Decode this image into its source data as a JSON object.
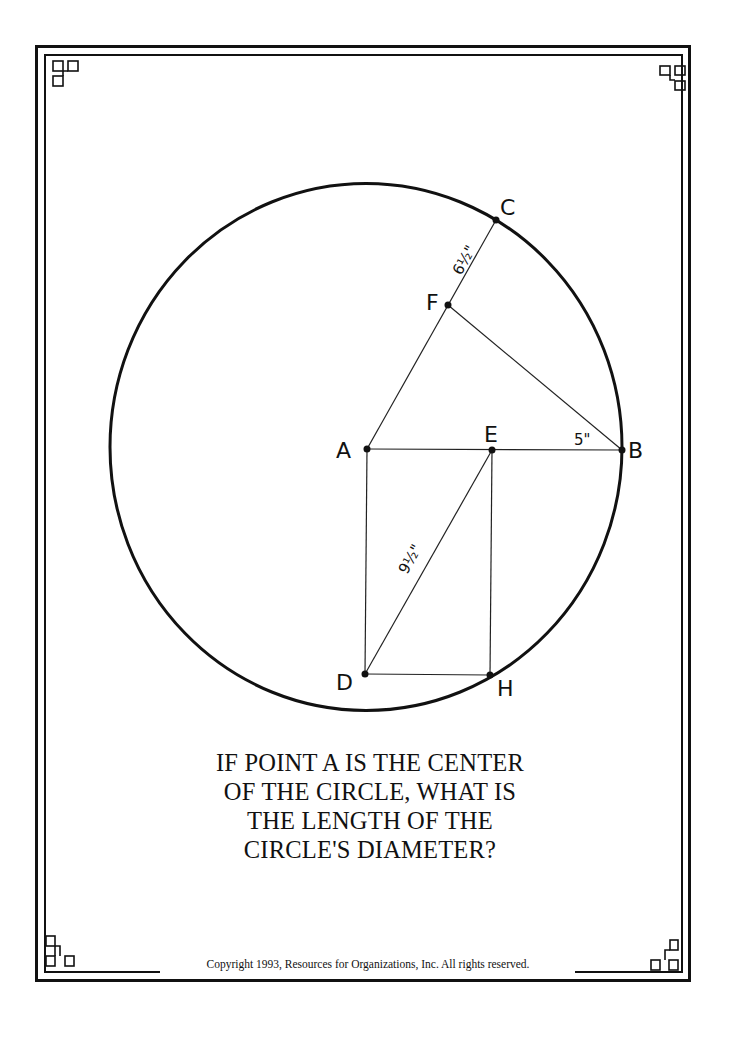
{
  "diagram": {
    "points": [
      {
        "name": "A",
        "x": 367,
        "y": 449
      },
      {
        "name": "B",
        "x": 622,
        "y": 450
      },
      {
        "name": "C",
        "x": 496,
        "y": 220
      },
      {
        "name": "D",
        "x": 365,
        "y": 674
      },
      {
        "name": "E",
        "x": 492,
        "y": 450
      },
      {
        "name": "F",
        "x": 448,
        "y": 305
      },
      {
        "name": "H",
        "x": 490,
        "y": 675
      }
    ],
    "segments": [
      "A-C",
      "A-B",
      "F-B",
      "A-D",
      "D-E",
      "E-H",
      "D-H"
    ],
    "circle": {
      "center": "A",
      "cx": 366,
      "cy": 447,
      "rx": 256,
      "ry": 263
    },
    "measurements": [
      {
        "segment": "F-C",
        "label": "6½\""
      },
      {
        "segment": "E-B",
        "label": "5\""
      },
      {
        "segment": "D-E",
        "label": "9½\""
      }
    ]
  },
  "labels": {
    "A": "A",
    "B": "B",
    "C": "C",
    "D": "D",
    "E": "E",
    "F": "F",
    "H": "H",
    "fc_length": "6½\"",
    "eb_length": "5\"",
    "de_length": "9½\""
  },
  "question": {
    "line1": "IF POINT A IS THE CENTER",
    "line2": "OF THE CIRCLE, WHAT IS",
    "line3": "THE LENGTH OF THE",
    "line4": "CIRCLE'S DIAMETER?"
  },
  "footer": {
    "copyright": "Copyright 1993, Resources for Organizations, Inc.  All rights reserved."
  },
  "colors": {
    "ink": "#111111",
    "paper": "#ffffff"
  }
}
